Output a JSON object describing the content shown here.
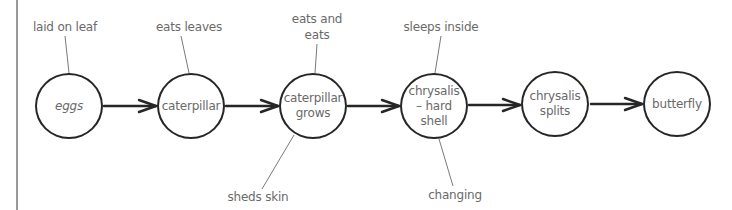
{
  "diagram": {
    "title": "",
    "type": "life-cycle flow",
    "colors": {
      "stroke": "#262626",
      "text": "#6a6a6a",
      "leader": "#7a7a7a",
      "frame": "#9a9a9a"
    },
    "nodes": [
      {
        "id": "eggs",
        "label": "eggs"
      },
      {
        "id": "caterpillar",
        "label": "caterpillar"
      },
      {
        "id": "caterpillar-grows",
        "label": "caterpillar\ngrows"
      },
      {
        "id": "chrysalis-hard-shell",
        "label": "chrysalis\n– hard\nshell"
      },
      {
        "id": "chrysalis-splits",
        "label": "chrysalis\nsplits"
      },
      {
        "id": "butterfly",
        "label": "butterfly"
      }
    ],
    "edges": [
      {
        "from": "eggs",
        "to": "caterpillar"
      },
      {
        "from": "caterpillar",
        "to": "caterpillar-grows"
      },
      {
        "from": "caterpillar-grows",
        "to": "chrysalis-hard-shell"
      },
      {
        "from": "chrysalis-hard-shell",
        "to": "chrysalis-splits"
      },
      {
        "from": "chrysalis-splits",
        "to": "butterfly"
      }
    ],
    "annotations": [
      {
        "node": "eggs",
        "position": "above",
        "text": "laid on leaf"
      },
      {
        "node": "caterpillar",
        "position": "above",
        "text": "eats leaves"
      },
      {
        "node": "caterpillar-grows",
        "position": "above",
        "text": "eats and\neats"
      },
      {
        "node": "caterpillar-grows",
        "position": "below",
        "text": "sheds skin"
      },
      {
        "node": "chrysalis-hard-shell",
        "position": "above",
        "text": "sleeps inside"
      },
      {
        "node": "chrysalis-hard-shell",
        "position": "below",
        "text": "changing"
      }
    ]
  }
}
